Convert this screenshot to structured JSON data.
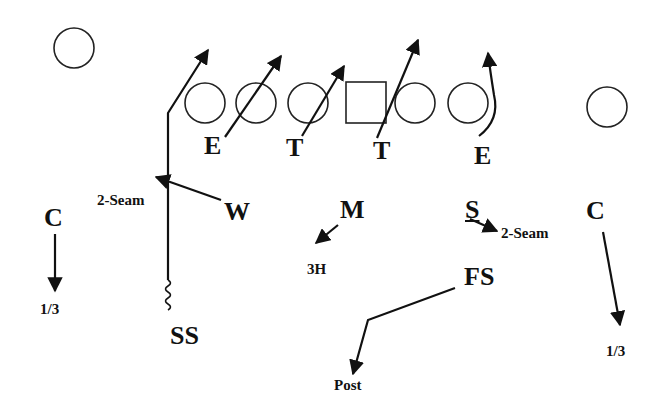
{
  "diagram": {
    "type": "football-defensive-coverage",
    "colors": {
      "ink": "#111111",
      "background": "#ffffff"
    },
    "offense": [
      {
        "id": "wr-left",
        "shape": "circle",
        "cx": 74,
        "cy": 48
      },
      {
        "id": "ol-1",
        "shape": "circle",
        "cx": 205,
        "cy": 103
      },
      {
        "id": "ol-2",
        "shape": "circle",
        "cx": 256,
        "cy": 103
      },
      {
        "id": "ol-3",
        "shape": "circle",
        "cx": 308,
        "cy": 103
      },
      {
        "id": "center",
        "shape": "square",
        "x": 346,
        "y": 82,
        "w": 40,
        "h": 41
      },
      {
        "id": "ol-4",
        "shape": "circle",
        "cx": 415,
        "cy": 103
      },
      {
        "id": "ol-5",
        "shape": "circle",
        "cx": 468,
        "cy": 103
      },
      {
        "id": "wr-right",
        "shape": "circle",
        "cx": 607,
        "cy": 107
      }
    ],
    "defenders": [
      {
        "id": "de-left",
        "label": "E",
        "x": 204,
        "y": 133,
        "size": "big"
      },
      {
        "id": "dt-left",
        "label": "T",
        "x": 286,
        "y": 135,
        "size": "big"
      },
      {
        "id": "dt-right",
        "label": "T",
        "x": 373,
        "y": 138,
        "size": "big"
      },
      {
        "id": "de-right",
        "label": "E",
        "x": 474,
        "y": 143,
        "size": "big"
      },
      {
        "id": "cb-left",
        "label": "C",
        "x": 44,
        "y": 205,
        "size": "big"
      },
      {
        "id": "will",
        "label": "W",
        "x": 224,
        "y": 199,
        "size": "big"
      },
      {
        "id": "mike",
        "label": "M",
        "x": 340,
        "y": 197,
        "size": "big"
      },
      {
        "id": "sam",
        "label": "S",
        "x": 465,
        "y": 197,
        "size": "big"
      },
      {
        "id": "cb-right",
        "label": "C",
        "x": 586,
        "y": 198,
        "size": "big"
      },
      {
        "id": "free-safety",
        "label": "FS",
        "x": 464,
        "y": 264,
        "size": "big"
      },
      {
        "id": "strong-safety",
        "label": "SS",
        "x": 170,
        "y": 323,
        "size": "big"
      }
    ],
    "assignments": [
      {
        "id": "will-assignment",
        "label": "2-Seam",
        "x": 97,
        "y": 193
      },
      {
        "id": "cb-left-assignment",
        "label": "1/3",
        "x": 40,
        "y": 302
      },
      {
        "id": "mike-assignment",
        "label": "3H",
        "x": 307,
        "y": 262
      },
      {
        "id": "sam-assignment",
        "label": "2-Seam",
        "x": 501,
        "y": 226
      },
      {
        "id": "cb-right-assignment",
        "label": "1/3",
        "x": 606,
        "y": 344
      },
      {
        "id": "fs-assignment",
        "label": "Post",
        "x": 334,
        "y": 378
      }
    ]
  }
}
